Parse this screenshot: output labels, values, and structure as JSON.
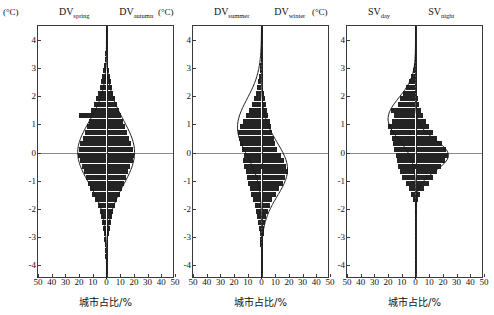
{
  "figure": {
    "unit_label": "(°C)",
    "x_axis_label": "城市占比/%",
    "x_ticks": [
      "50",
      "40",
      "30",
      "20",
      "10",
      "0",
      "10",
      "20",
      "30",
      "40",
      "50"
    ],
    "y_ticks": [
      "4",
      "3",
      "2",
      "1",
      "0",
      "-1",
      "-2",
      "-3",
      "-4"
    ],
    "bar_color": "#242424",
    "curve_color": "#1a1a1a",
    "axis_color": "#3a3a3a"
  },
  "chart_data": [
    {
      "type": "bar",
      "panel": 1,
      "title": "Panel 1",
      "left_series_name": "DV_spring",
      "right_series_name": "DV_autumn",
      "left_label_html": "DV<sub>spring</sub>",
      "right_label_html": "DV<sub>autumn</sub>",
      "xlabel": "城市占比/%",
      "ylabel": "(°C)",
      "ylim": [
        -4.5,
        4.5
      ],
      "xlim": [
        -50,
        50
      ],
      "grid": false,
      "bin_width": 0.2,
      "bins": [
        -4.3,
        -4.1,
        -3.9,
        -3.7,
        -3.5,
        -3.3,
        -3.1,
        -2.9,
        -2.7,
        -2.5,
        -2.3,
        -2.1,
        -1.9,
        -1.7,
        -1.5,
        -1.3,
        -1.1,
        -0.9,
        -0.7,
        -0.5,
        -0.3,
        -0.1,
        0.1,
        0.3,
        0.5,
        0.7,
        0.9,
        1.1,
        1.3,
        1.5,
        1.7,
        1.9,
        2.1,
        2.3,
        2.5,
        2.7,
        2.9,
        3.1,
        3.3,
        3.5,
        3.7,
        3.9,
        4.1,
        4.3
      ],
      "left_values": [
        0.3,
        0.4,
        0.6,
        0.8,
        1.0,
        1.3,
        1.6,
        2.0,
        2.6,
        3.2,
        4.0,
        5.0,
        6.5,
        8.5,
        10.5,
        12.0,
        13.5,
        15.0,
        16.5,
        18.0,
        19.5,
        20.5,
        20.0,
        19.0,
        17.5,
        16.0,
        14.5,
        13.0,
        20.0,
        11.0,
        9.0,
        7.5,
        6.0,
        5.0,
        4.0,
        3.0,
        2.2,
        1.6,
        1.2,
        0.9,
        0.7,
        0.5,
        0.4,
        0.3
      ],
      "right_values": [
        0.3,
        0.4,
        0.5,
        0.7,
        0.9,
        1.1,
        1.4,
        1.8,
        2.3,
        3.0,
        3.8,
        4.8,
        6.0,
        7.5,
        9.5,
        11.5,
        13.0,
        14.5,
        16.0,
        17.5,
        19.0,
        20.0,
        19.5,
        18.0,
        16.5,
        15.0,
        13.5,
        12.0,
        10.5,
        9.0,
        7.5,
        6.0,
        5.0,
        4.0,
        3.2,
        2.5,
        1.9,
        1.4,
        1.1,
        0.8,
        0.6,
        0.5,
        0.4,
        0.3
      ],
      "left_curve_peak_y": 0.0,
      "right_curve_peak_y": 0.0,
      "left_curve_peak_x": 21.0,
      "right_curve_peak_x": 20.5,
      "left_curve_sigma": 1.1,
      "right_curve_sigma": 1.15,
      "annotations": []
    },
    {
      "type": "bar",
      "panel": 2,
      "title": "Panel 2",
      "left_series_name": "DV_summer",
      "right_series_name": "DV_winter",
      "left_label_html": "DV<sub>summer</sub>",
      "right_label_html": "DV<sub>winter</sub>",
      "xlabel": "城市占比/%",
      "ylabel": "(°C)",
      "ylim": [
        -4.5,
        4.5
      ],
      "xlim": [
        -50,
        50
      ],
      "grid": false,
      "bin_width": 0.2,
      "bins": [
        -4.3,
        -4.1,
        -3.9,
        -3.7,
        -3.5,
        -3.3,
        -3.1,
        -2.9,
        -2.7,
        -2.5,
        -2.3,
        -2.1,
        -1.9,
        -1.7,
        -1.5,
        -1.3,
        -1.1,
        -0.9,
        -0.7,
        -0.5,
        -0.3,
        -0.1,
        0.1,
        0.3,
        0.5,
        0.7,
        0.9,
        1.1,
        1.3,
        1.5,
        1.7,
        1.9,
        2.1,
        2.3,
        2.5,
        2.7,
        2.9,
        3.1,
        3.3,
        3.5,
        3.7,
        3.9,
        4.1,
        4.3
      ],
      "left_values": [
        0.2,
        0.3,
        0.4,
        0.5,
        0.7,
        0.9,
        1.1,
        1.4,
        1.8,
        2.3,
        3.0,
        3.8,
        5.0,
        6.5,
        7.5,
        8.5,
        9.5,
        10.5,
        11.5,
        12.5,
        13.5,
        13.0,
        14.5,
        15.5,
        16.5,
        17.5,
        16.0,
        13.5,
        11.0,
        9.0,
        7.0,
        5.5,
        4.0,
        3.0,
        2.2,
        1.6,
        1.2,
        0.9,
        0.7,
        0.5,
        0.4,
        0.3,
        0.2,
        0.2
      ],
      "right_values": [
        0.2,
        0.3,
        0.4,
        0.5,
        0.7,
        0.9,
        1.2,
        1.6,
        2.1,
        2.8,
        3.6,
        4.5,
        6.0,
        8.0,
        10.5,
        13.0,
        15.5,
        17.5,
        19.0,
        18.0,
        16.5,
        14.0,
        11.5,
        10.0,
        9.0,
        8.0,
        7.0,
        6.0,
        5.0,
        4.0,
        3.2,
        2.5,
        1.9,
        1.4,
        1.1,
        0.8,
        0.6,
        0.5,
        0.4,
        0.3,
        0.2,
        0.2,
        0.2,
        0.1
      ],
      "left_curve_peak_y": 0.9,
      "right_curve_peak_y": -0.6,
      "left_curve_peak_x": 17.5,
      "right_curve_peak_x": 19.0,
      "left_curve_sigma": 1.0,
      "right_curve_sigma": 0.95,
      "annotations": []
    },
    {
      "type": "bar",
      "panel": 3,
      "title": "Panel 3",
      "left_series_name": "SV_day",
      "right_series_name": "SV_night",
      "left_label_html": "SV<sub>day</sub>",
      "right_label_html": "SV<sub>night</sub>",
      "xlabel": "城市占比/%",
      "ylabel": "(°C)",
      "ylim": [
        -4.5,
        4.5
      ],
      "xlim": [
        -50,
        50
      ],
      "grid": false,
      "bin_width": 0.2,
      "bins": [
        -4.3,
        -4.1,
        -3.9,
        -3.7,
        -3.5,
        -3.3,
        -3.1,
        -2.9,
        -2.7,
        -2.5,
        -2.3,
        -2.1,
        -1.9,
        -1.7,
        -1.5,
        -1.3,
        -1.1,
        -0.9,
        -0.7,
        -0.5,
        -0.3,
        -0.1,
        0.1,
        0.3,
        0.5,
        0.7,
        0.9,
        1.1,
        1.3,
        1.5,
        1.7,
        1.9,
        2.1,
        2.3,
        2.5,
        2.7,
        2.9,
        3.1,
        3.3,
        3.5,
        3.7,
        3.9,
        4.1,
        4.3
      ],
      "left_values": [
        0,
        0,
        0,
        0,
        0,
        0,
        0,
        0,
        0,
        0,
        0,
        0.3,
        0.6,
        1.5,
        3.0,
        5.0,
        7.0,
        9.5,
        11.0,
        12.5,
        13.5,
        14.5,
        15.5,
        16.5,
        17.5,
        18.5,
        20.0,
        17.0,
        15.5,
        18.0,
        13.0,
        11.0,
        9.0,
        7.0,
        5.0,
        3.5,
        2.0,
        1.0,
        0.5,
        0.2,
        0,
        0,
        0,
        0
      ],
      "right_values": [
        0,
        0,
        0,
        0,
        0,
        0,
        0,
        0,
        0,
        0,
        0,
        0.2,
        0.5,
        1.5,
        3.5,
        6.5,
        9.5,
        12.5,
        15.5,
        18.5,
        21.5,
        24.0,
        22.0,
        19.0,
        16.0,
        13.0,
        10.0,
        7.5,
        5.5,
        4.0,
        2.8,
        1.9,
        1.2,
        0.8,
        0.5,
        0.3,
        0.2,
        0.1,
        0,
        0,
        0,
        0,
        0,
        0
      ],
      "left_curve_peak_y": 1.2,
      "right_curve_peak_y": -0.1,
      "left_curve_peak_x": 20.0,
      "right_curve_peak_x": 24.0,
      "left_curve_sigma": 0.75,
      "right_curve_sigma": 0.55,
      "annotations": []
    }
  ]
}
